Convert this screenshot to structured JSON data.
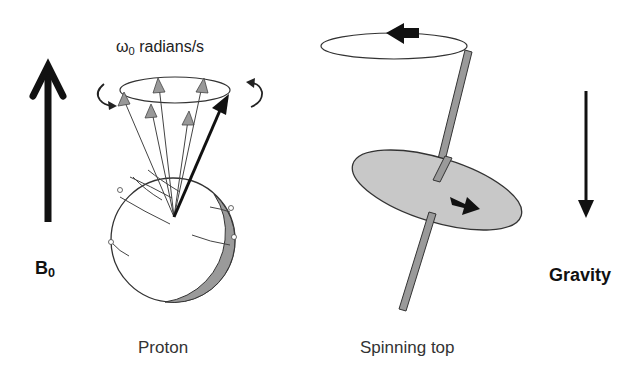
{
  "figure": {
    "left_panel": {
      "field_label": "B",
      "field_subscript": "0",
      "precession_label_symbol": "ω",
      "precession_label_subscript": "0",
      "precession_label_units": " radians/s",
      "caption": "Proton"
    },
    "right_panel": {
      "force_label": "Gravity",
      "caption": "Spinning top"
    },
    "colors": {
      "stroke": "#222222",
      "arrow_fill": "#111111",
      "gray_fill": "#9a9a9a",
      "disk_fill": "#c8c8c8",
      "background": "#ffffff"
    }
  }
}
